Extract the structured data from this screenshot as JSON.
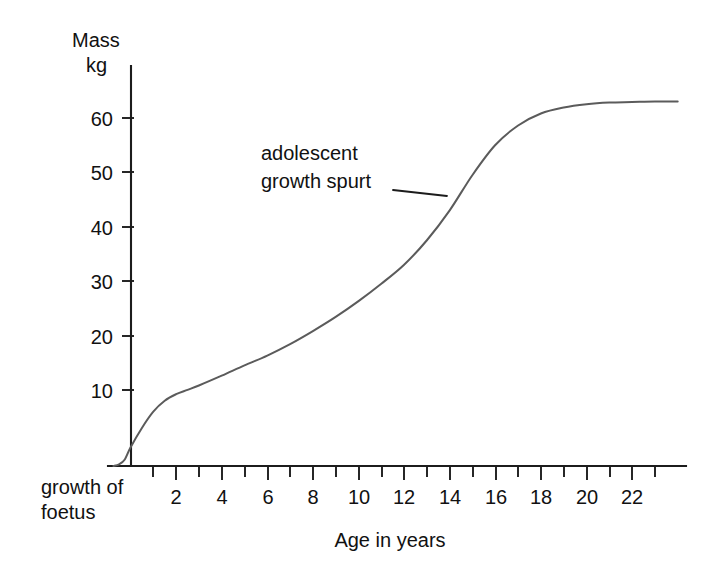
{
  "chart_data": {
    "type": "line",
    "title": "",
    "xlabel": "Age in years",
    "ylabel": "Mass kg",
    "ylabel_line1": "Mass",
    "ylabel_line2": "kg",
    "xlim": [
      -0.8,
      24.5
    ],
    "ylim": [
      0,
      72
    ],
    "grid": false,
    "legend": "none",
    "x_ticks_major": [
      2,
      4,
      6,
      8,
      10,
      12,
      14,
      16,
      18,
      20,
      22
    ],
    "x_ticks_all": [
      1,
      2,
      3,
      4,
      5,
      6,
      7,
      8,
      9,
      10,
      11,
      12,
      13,
      14,
      15,
      16,
      17,
      18,
      19,
      20,
      21,
      22,
      23
    ],
    "x_tick_labels": [
      "2",
      "4",
      "6",
      "8",
      "10",
      "12",
      "14",
      "16",
      "18",
      "20",
      "22"
    ],
    "y_ticks": [
      10,
      20,
      30,
      40,
      50,
      60
    ],
    "y_tick_labels": [
      "10",
      "20",
      "30",
      "40",
      "50",
      "60"
    ],
    "series": [
      {
        "name": "Human growth curve",
        "color": "#5b5b5b",
        "x": [
          -0.75,
          -0.5,
          -0.25,
          0,
          0.5,
          1,
          1.5,
          2,
          2.5,
          3,
          4,
          5,
          6,
          7,
          8,
          9,
          10,
          11,
          12,
          13,
          14,
          15,
          16,
          17,
          18,
          19,
          20,
          21,
          22,
          23,
          24
        ],
        "y": [
          0,
          0.3,
          1.2,
          3.4,
          7.0,
          10.0,
          12.0,
          13.2,
          14.0,
          14.8,
          16.6,
          18.5,
          20.3,
          22.4,
          24.8,
          27.4,
          30.3,
          33.5,
          37.0,
          41.5,
          47.0,
          53.5,
          59.0,
          62.6,
          64.8,
          65.9,
          66.5,
          66.8,
          66.9,
          67.0,
          67.0
        ]
      }
    ],
    "annotations": [
      {
        "name": "adolescent-growth-spurt",
        "text_line1": "adolescent",
        "text_line2": "growth spurt",
        "point_x": 14.0,
        "point_y": 47.5
      },
      {
        "name": "growth-of-foetus",
        "text_line1": "growth of",
        "text_line2": "foetus"
      }
    ]
  },
  "axes": {
    "y_title_line1": "Mass",
    "y_title_line2": "kg",
    "x_title": "Age in years"
  },
  "ticks": {
    "y": [
      "10",
      "20",
      "30",
      "40",
      "50",
      "60"
    ],
    "x": [
      "2",
      "4",
      "6",
      "8",
      "10",
      "12",
      "14",
      "16",
      "18",
      "20",
      "22"
    ]
  },
  "annotation": {
    "spurt_line1": "adolescent",
    "spurt_line2": "growth spurt",
    "foetus_line1": "growth of",
    "foetus_line2": "foetus"
  },
  "colors": {
    "curve": "#5b5b5b",
    "axis": "#1c1c1c",
    "text": "#111111",
    "background": "#ffffff"
  }
}
